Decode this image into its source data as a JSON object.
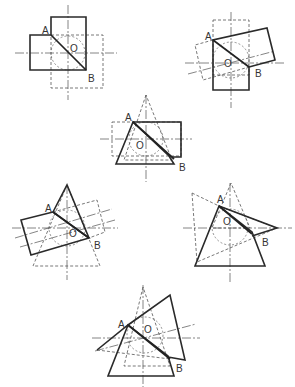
{
  "figure": {
    "colors": {
      "line": "#2a2a2a",
      "dashed": "#555555",
      "background": "#ffffff"
    }
  },
  "panels": [
    {
      "id": 1,
      "labels": {
        "a": "A",
        "b": "B",
        "o": "O"
      }
    },
    {
      "id": 2,
      "labels": {
        "a": "A",
        "b": "B",
        "o": "O"
      }
    },
    {
      "id": 3,
      "labels": {
        "a": "A",
        "b": "B",
        "o": "O"
      }
    },
    {
      "id": 4,
      "labels": {
        "a": "A",
        "b": "B",
        "o": "O"
      }
    },
    {
      "id": 5,
      "labels": {
        "a": "A",
        "b": "B",
        "o": "O"
      }
    },
    {
      "id": 6,
      "labels": {
        "a": "A",
        "b": "B",
        "o": "O"
      }
    }
  ]
}
